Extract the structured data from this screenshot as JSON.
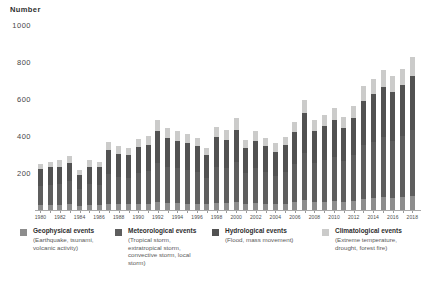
{
  "page": {
    "background": "#ffffff",
    "title": "Number"
  },
  "chart_data": {
    "type": "bar",
    "stacked": true,
    "title": "Number",
    "xlabel": "",
    "ylabel": "Number",
    "ylim": [
      0,
      1000
    ],
    "y_ticks": [
      200,
      400,
      600,
      800,
      1000
    ],
    "x_tick_step": 2,
    "grid": false,
    "legend_position": "bottom",
    "categories": [
      1980,
      1981,
      1982,
      1983,
      1984,
      1985,
      1986,
      1987,
      1988,
      1989,
      1990,
      1991,
      1992,
      1993,
      1994,
      1995,
      1996,
      1997,
      1998,
      1999,
      2000,
      2001,
      2002,
      2003,
      2004,
      2005,
      2006,
      2007,
      2008,
      2009,
      2010,
      2011,
      2012,
      2013,
      2014,
      2015,
      2016,
      2017,
      2018
    ],
    "series": [
      {
        "name": "Geophysical events",
        "description": "(Earthquake, tsunami, volcanic activity)",
        "color": "#8d8d8d",
        "values": [
          25,
          25,
          25,
          30,
          20,
          25,
          25,
          35,
          30,
          30,
          35,
          35,
          45,
          40,
          40,
          35,
          35,
          30,
          40,
          40,
          45,
          35,
          40,
          35,
          30,
          35,
          45,
          55,
          45,
          45,
          50,
          45,
          50,
          60,
          65,
          70,
          65,
          70,
          75
        ]
      },
      {
        "name": "Meteorological events",
        "description": "(Tropical storm, extratropical storm, convective storm, local storm)",
        "color": "#5e5e5e",
        "values": [
          105,
          110,
          115,
          125,
          95,
          115,
          110,
          160,
          150,
          145,
          165,
          175,
          210,
          190,
          185,
          180,
          170,
          145,
          195,
          185,
          215,
          165,
          185,
          170,
          155,
          170,
          205,
          255,
          210,
          225,
          235,
          220,
          245,
          290,
          305,
          325,
          310,
          330,
          355
        ]
      },
      {
        "name": "Hydrological events",
        "description": "(Flood, mass movement)",
        "color": "#525252",
        "values": [
          90,
          95,
          95,
          100,
          75,
          95,
          95,
          130,
          125,
          120,
          140,
          140,
          170,
          160,
          150,
          145,
          140,
          120,
          160,
          155,
          175,
          135,
          150,
          140,
          130,
          145,
          170,
          215,
          170,
          185,
          200,
          180,
          205,
          240,
          255,
          270,
          265,
          275,
          295
        ]
      },
      {
        "name": "Climatological events",
        "description": "(Extreme temperature, drought, forest fire)",
        "color": "#cbcbca",
        "values": [
          30,
          30,
          35,
          35,
          25,
          35,
          30,
          45,
          40,
          40,
          45,
          50,
          60,
          55,
          50,
          50,
          45,
          40,
          55,
          50,
          60,
          45,
          50,
          45,
          45,
          45,
          55,
          70,
          60,
          60,
          65,
          60,
          65,
          80,
          85,
          90,
          85,
          90,
          100
        ]
      }
    ],
    "totals": [
      250,
      260,
      270,
      290,
      215,
      270,
      260,
      370,
      345,
      335,
      385,
      400,
      485,
      445,
      425,
      410,
      390,
      335,
      450,
      430,
      495,
      380,
      425,
      390,
      360,
      395,
      475,
      595,
      485,
      515,
      550,
      505,
      565,
      670,
      710,
      755,
      725,
      765,
      825
    ]
  }
}
